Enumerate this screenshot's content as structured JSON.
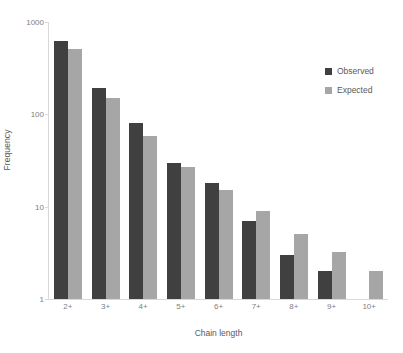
{
  "chart_data": {
    "type": "bar",
    "title": "",
    "xlabel": "Chain length",
    "ylabel": "Frequency",
    "categories": [
      "2+",
      "3+",
      "4+",
      "5+",
      "6+",
      "7+",
      "8+",
      "9+",
      "10+"
    ],
    "series": [
      {
        "name": "Observed",
        "color": "#404040",
        "values": [
          620,
          195,
          80,
          30,
          18,
          7,
          3,
          2,
          null
        ]
      },
      {
        "name": "Expected",
        "color": "#a6a6a6",
        "values": [
          510,
          150,
          58,
          27,
          15,
          9,
          5,
          3.2,
          2
        ]
      }
    ],
    "yscale": "log",
    "ylim": [
      1,
      1000
    ],
    "y_ticks": [
      "1",
      "10",
      "100",
      "1000"
    ],
    "grid": false,
    "legend_position": "right"
  },
  "axes": {
    "y_title": "Frequency",
    "x_title": "Chain length",
    "y_tick_labels": [
      "1000",
      "100",
      "10",
      "1"
    ],
    "x_tick_labels": [
      "2+",
      "3+",
      "4+",
      "5+",
      "6+",
      "7+",
      "8+",
      "9+",
      "10+"
    ]
  },
  "legend": {
    "items": [
      {
        "label": "Observed",
        "color": "#404040"
      },
      {
        "label": "Expected",
        "color": "#a6a6a6"
      }
    ]
  },
  "colors": {
    "observed": "#404040",
    "expected": "#a6a6a6",
    "axis": "#d9d9d9",
    "tick_text": "#808080",
    "title_text": "#595959",
    "background": "#ffffff"
  }
}
